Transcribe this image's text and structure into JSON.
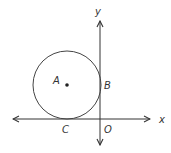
{
  "diagram": {
    "type": "coordinate-geometry",
    "colors": {
      "stroke": "#333333",
      "background": "#ffffff"
    },
    "axes": {
      "x_label": "x",
      "y_label": "y",
      "origin_label": "O"
    },
    "circle": {
      "center_label": "A",
      "tangent_point_y_axis_label": "B",
      "tangent_point_x_axis_label": "C"
    }
  }
}
